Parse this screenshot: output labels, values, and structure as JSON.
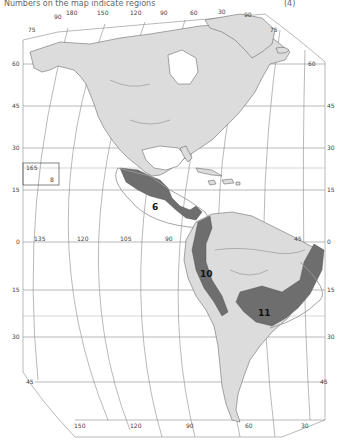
{
  "title": {
    "text": "Numbers on the map indicate regions",
    "suffix": "(4)"
  },
  "colors": {
    "land": "#dcdcdc",
    "region": "#6e6e6e",
    "ocean": "#ffffff",
    "grid": "#8a8a8a"
  },
  "top_longitude_labels": [
    "90",
    "180",
    "150",
    "120",
    "90",
    "60",
    "30",
    "90"
  ],
  "left_latitude_labels": [
    "75",
    "60",
    "45",
    "30",
    "15",
    "0",
    "15",
    "30",
    "45"
  ],
  "right_latitude_labels": [
    "75",
    "60",
    "45",
    "30",
    "15",
    "0",
    "15",
    "30",
    "45"
  ],
  "equator_longitude_labels": [
    "135",
    "120",
    "105",
    "90",
    "45"
  ],
  "bottom_longitude_labels": [
    "150",
    "120",
    "90",
    "60",
    "30"
  ],
  "inset": {
    "label": "165",
    "sub_label": "8"
  },
  "regions": [
    {
      "id": "6",
      "label": "6"
    },
    {
      "id": "10",
      "label": "10"
    },
    {
      "id": "11",
      "label": "11"
    }
  ]
}
